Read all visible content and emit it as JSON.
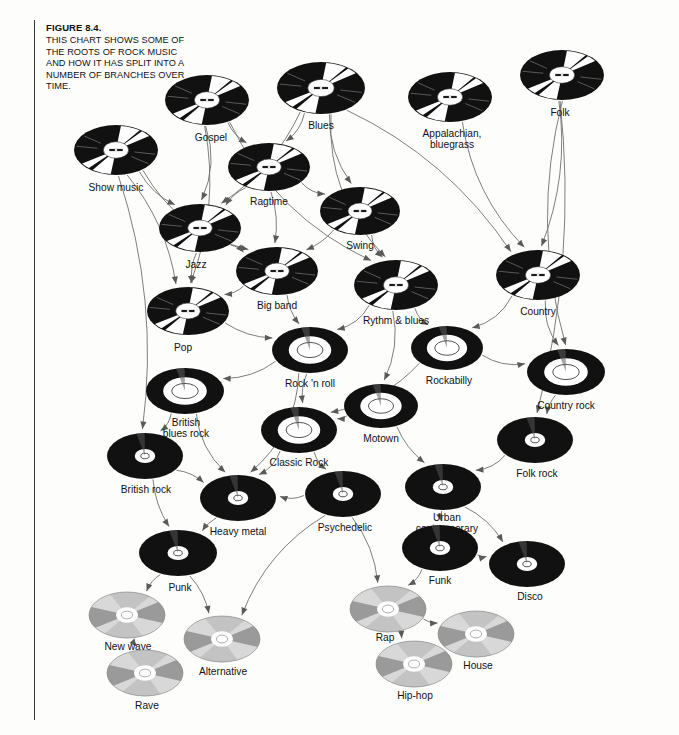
{
  "figure": {
    "number": "FIGURE 8.4.",
    "caption": "THIS CHART SHOWS SOME OF THE ROOTS OF ROCK MUSIC AND HOW IT HAS SPLIT INTO A NUMBER OF BRANCHES OVER TIME."
  },
  "colors": {
    "background": "#fdfdfc",
    "vinyl": "#111111",
    "vinyl_sheen": "#ffffff",
    "label_white": "#ffffff",
    "edge": "#6f6f6f",
    "arrow": "#5a5a5a",
    "rule": "#3a3a3a",
    "text": "#111111",
    "cd_light": "#d8d8d8",
    "cd_dark": "#9a9a9a",
    "cd_hub": "#ffffff"
  },
  "chart_data": {
    "type": "diagram",
    "title": "This chart shows some of the roots of rock music and how it has split into a number of branches over time.",
    "node_count": 35,
    "media_styles": {
      "vinyl78": "black 78rpm record with small printed center label and radial white sheen wedges",
      "lp_big": "black LP with large white label ring and inner outlined ellipse",
      "lp_small": "black LP with small white center label",
      "cd": "silver compact disc with alternating light/dark quadrant sheen and white hub"
    },
    "nodes": [
      {
        "id": "show_music",
        "label": "Show music",
        "x": 116,
        "y": 150,
        "rx": 42,
        "ry": 25,
        "style": "vinyl78",
        "lx": 116,
        "ly": 182,
        "align": "center"
      },
      {
        "id": "gospel",
        "label": "Gospel",
        "x": 207,
        "y": 100,
        "rx": 42,
        "ry": 25,
        "style": "vinyl78",
        "lx": 211,
        "ly": 132,
        "align": "center"
      },
      {
        "id": "blues",
        "label": "Blues",
        "x": 321,
        "y": 88,
        "rx": 44,
        "ry": 26,
        "style": "vinyl78",
        "lx": 321,
        "ly": 120,
        "align": "center"
      },
      {
        "id": "appalachian",
        "label": "Appalachian,\nbluegrass",
        "x": 450,
        "y": 97,
        "rx": 42,
        "ry": 25,
        "style": "vinyl78",
        "lx": 452,
        "ly": 128,
        "align": "center"
      },
      {
        "id": "folk",
        "label": "Folk",
        "x": 562,
        "y": 75,
        "rx": 42,
        "ry": 25,
        "style": "vinyl78",
        "lx": 560,
        "ly": 107,
        "align": "center"
      },
      {
        "id": "ragtime",
        "label": "Ragtime",
        "x": 269,
        "y": 167,
        "rx": 41,
        "ry": 24,
        "style": "vinyl78",
        "lx": 269,
        "ly": 196,
        "align": "center"
      },
      {
        "id": "swing",
        "label": "Swing",
        "x": 360,
        "y": 211,
        "rx": 40,
        "ry": 24,
        "style": "vinyl78",
        "lx": 360,
        "ly": 240,
        "align": "center"
      },
      {
        "id": "jazz",
        "label": "Jazz",
        "x": 200,
        "y": 228,
        "rx": 41,
        "ry": 24,
        "style": "vinyl78",
        "lx": 196,
        "ly": 259,
        "align": "center"
      },
      {
        "id": "big_band",
        "label": "Big band",
        "x": 277,
        "y": 271,
        "rx": 41,
        "ry": 24,
        "style": "vinyl78",
        "lx": 277,
        "ly": 300,
        "align": "center"
      },
      {
        "id": "rythm_blues",
        "label": "Rythm & blues",
        "x": 396,
        "y": 285,
        "rx": 42,
        "ry": 25,
        "style": "vinyl78",
        "lx": 396,
        "ly": 315,
        "align": "center"
      },
      {
        "id": "country",
        "label": "Country",
        "x": 538,
        "y": 275,
        "rx": 42,
        "ry": 25,
        "style": "vinyl78",
        "lx": 538,
        "ly": 306,
        "align": "center"
      },
      {
        "id": "pop",
        "label": "Pop",
        "x": 188,
        "y": 311,
        "rx": 41,
        "ry": 24,
        "style": "vinyl78",
        "lx": 183,
        "ly": 342,
        "align": "center"
      },
      {
        "id": "rock_n_roll",
        "label": "Rock 'n roll",
        "x": 310,
        "y": 350,
        "rx": 38,
        "ry": 23,
        "style": "lp_big",
        "lx": 310,
        "ly": 378,
        "align": "center"
      },
      {
        "id": "rockabilly",
        "label": "Rockabilly",
        "x": 447,
        "y": 348,
        "rx": 36,
        "ry": 22,
        "style": "lp_big",
        "lx": 449,
        "ly": 375,
        "align": "center"
      },
      {
        "id": "country_rock",
        "label": "Country rock",
        "x": 566,
        "y": 372,
        "rx": 39,
        "ry": 23,
        "style": "lp_big",
        "lx": 566,
        "ly": 400,
        "align": "center"
      },
      {
        "id": "british_blues_rock",
        "label": "British\nblues rock",
        "x": 185,
        "y": 391,
        "rx": 39,
        "ry": 23,
        "style": "lp_big",
        "lx": 186,
        "ly": 417,
        "align": "center"
      },
      {
        "id": "motown",
        "label": "Motown",
        "x": 381,
        "y": 406,
        "rx": 37,
        "ry": 22,
        "style": "lp_big",
        "lx": 381,
        "ly": 433,
        "align": "center"
      },
      {
        "id": "classic_rock",
        "label": "Classic Rock",
        "x": 299,
        "y": 430,
        "rx": 38,
        "ry": 23,
        "style": "lp_big",
        "lx": 299,
        "ly": 457,
        "align": "center"
      },
      {
        "id": "folk_rock",
        "label": "Folk rock",
        "x": 535,
        "y": 440,
        "rx": 38,
        "ry": 23,
        "style": "lp_small",
        "lx": 537,
        "ly": 468,
        "align": "center"
      },
      {
        "id": "british_rock",
        "label": "British rock",
        "x": 145,
        "y": 456,
        "rx": 38,
        "ry": 23,
        "style": "lp_small",
        "lx": 146,
        "ly": 484,
        "align": "center"
      },
      {
        "id": "urban_contemporary",
        "label": "Urban\ncontemporary",
        "x": 443,
        "y": 487,
        "rx": 38,
        "ry": 23,
        "style": "lp_small",
        "lx": 447,
        "ly": 512,
        "align": "center"
      },
      {
        "id": "heavy_metal",
        "label": "Heavy metal",
        "x": 238,
        "y": 498,
        "rx": 38,
        "ry": 23,
        "style": "lp_small",
        "lx": 238,
        "ly": 526,
        "align": "center"
      },
      {
        "id": "psychedelic",
        "label": "Psychedelic",
        "x": 343,
        "y": 494,
        "rx": 38,
        "ry": 23,
        "style": "lp_small",
        "lx": 345,
        "ly": 522,
        "align": "center"
      },
      {
        "id": "funk",
        "label": "Funk",
        "x": 440,
        "y": 548,
        "rx": 38,
        "ry": 23,
        "style": "lp_small",
        "lx": 440,
        "ly": 575,
        "align": "center"
      },
      {
        "id": "disco",
        "label": "Disco",
        "x": 527,
        "y": 564,
        "rx": 38,
        "ry": 23,
        "style": "lp_small",
        "lx": 530,
        "ly": 591,
        "align": "center"
      },
      {
        "id": "punk",
        "label": "Punk",
        "x": 178,
        "y": 553,
        "rx": 39,
        "ry": 23,
        "style": "lp_small",
        "lx": 180,
        "ly": 582,
        "align": "center"
      },
      {
        "id": "rap",
        "label": "Rap",
        "x": 388,
        "y": 609,
        "rx": 38,
        "ry": 23,
        "style": "cd",
        "lx": 385,
        "ly": 632,
        "align": "center"
      },
      {
        "id": "new_wave",
        "label": "New wave",
        "x": 127,
        "y": 615,
        "rx": 38,
        "ry": 23,
        "style": "cd",
        "lx": 128,
        "ly": 641,
        "align": "center"
      },
      {
        "id": "house",
        "label": "House",
        "x": 476,
        "y": 634,
        "rx": 38,
        "ry": 23,
        "style": "cd",
        "lx": 478,
        "ly": 660,
        "align": "center"
      },
      {
        "id": "alternative",
        "label": "Alternative",
        "x": 222,
        "y": 639,
        "rx": 38,
        "ry": 23,
        "style": "cd",
        "lx": 223,
        "ly": 666,
        "align": "center"
      },
      {
        "id": "hip_hop",
        "label": "Hip-hop",
        "x": 414,
        "y": 664,
        "rx": 38,
        "ry": 23,
        "style": "cd",
        "lx": 415,
        "ly": 690,
        "align": "center"
      },
      {
        "id": "rave",
        "label": "Rave",
        "x": 145,
        "y": 673,
        "rx": 38,
        "ry": 23,
        "style": "cd",
        "lx": 147,
        "ly": 700,
        "align": "center"
      }
    ],
    "edges": [
      {
        "from": "gospel",
        "to": "jazz"
      },
      {
        "from": "gospel",
        "to": "ragtime"
      },
      {
        "from": "gospel",
        "to": "pop"
      },
      {
        "from": "gospel",
        "to": "rythm_blues"
      },
      {
        "from": "blues",
        "to": "ragtime"
      },
      {
        "from": "blues",
        "to": "swing"
      },
      {
        "from": "blues",
        "to": "jazz"
      },
      {
        "from": "blues",
        "to": "rythm_blues"
      },
      {
        "from": "blues",
        "to": "country"
      },
      {
        "from": "show_music",
        "to": "jazz"
      },
      {
        "from": "show_music",
        "to": "pop"
      },
      {
        "from": "show_music",
        "to": "big_band"
      },
      {
        "from": "show_music",
        "to": "british_rock"
      },
      {
        "from": "appalachian",
        "to": "country"
      },
      {
        "from": "folk",
        "to": "country"
      },
      {
        "from": "folk",
        "to": "country_rock"
      },
      {
        "from": "folk",
        "to": "folk_rock"
      },
      {
        "from": "ragtime",
        "to": "jazz"
      },
      {
        "from": "ragtime",
        "to": "big_band"
      },
      {
        "from": "ragtime",
        "to": "swing"
      },
      {
        "from": "jazz",
        "to": "big_band"
      },
      {
        "from": "jazz",
        "to": "pop"
      },
      {
        "from": "swing",
        "to": "big_band"
      },
      {
        "from": "swing",
        "to": "rythm_blues"
      },
      {
        "from": "big_band",
        "to": "pop"
      },
      {
        "from": "big_band",
        "to": "rock_n_roll"
      },
      {
        "from": "rythm_blues",
        "to": "rock_n_roll"
      },
      {
        "from": "rythm_blues",
        "to": "rockabilly"
      },
      {
        "from": "rythm_blues",
        "to": "motown"
      },
      {
        "from": "pop",
        "to": "rock_n_roll"
      },
      {
        "from": "country",
        "to": "rockabilly"
      },
      {
        "from": "country",
        "to": "country_rock"
      },
      {
        "from": "rock_n_roll",
        "to": "british_blues_rock"
      },
      {
        "from": "rock_n_roll",
        "to": "classic_rock"
      },
      {
        "from": "rock_n_roll",
        "to": "heavy_metal"
      },
      {
        "from": "rockabilly",
        "to": "country_rock"
      },
      {
        "from": "rockabilly",
        "to": "classic_rock"
      },
      {
        "from": "country_rock",
        "to": "folk_rock"
      },
      {
        "from": "british_blues_rock",
        "to": "british_rock"
      },
      {
        "from": "british_blues_rock",
        "to": "heavy_metal"
      },
      {
        "from": "motown",
        "to": "classic_rock"
      },
      {
        "from": "motown",
        "to": "urban_contemporary"
      },
      {
        "from": "classic_rock",
        "to": "heavy_metal"
      },
      {
        "from": "classic_rock",
        "to": "psychedelic"
      },
      {
        "from": "british_rock",
        "to": "heavy_metal"
      },
      {
        "from": "british_rock",
        "to": "punk"
      },
      {
        "from": "folk_rock",
        "to": "urban_contemporary"
      },
      {
        "from": "urban_contemporary",
        "to": "funk"
      },
      {
        "from": "urban_contemporary",
        "to": "disco"
      },
      {
        "from": "heavy_metal",
        "to": "punk"
      },
      {
        "from": "psychedelic",
        "to": "heavy_metal"
      },
      {
        "from": "psychedelic",
        "to": "alternative"
      },
      {
        "from": "psychedelic",
        "to": "rap"
      },
      {
        "from": "funk",
        "to": "disco"
      },
      {
        "from": "funk",
        "to": "rap"
      },
      {
        "from": "punk",
        "to": "new_wave"
      },
      {
        "from": "punk",
        "to": "alternative"
      },
      {
        "from": "new_wave",
        "to": "rave"
      },
      {
        "from": "rap",
        "to": "hip_hop"
      },
      {
        "from": "rap",
        "to": "house"
      }
    ]
  }
}
